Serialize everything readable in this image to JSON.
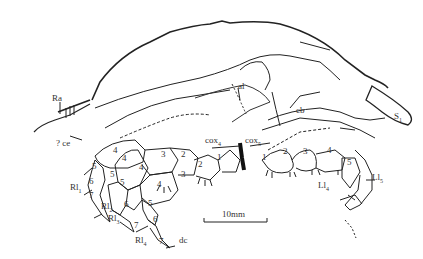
{
  "figure": {
    "type": "line drawing of fossil arthropod (lateral view)",
    "scale_bar": {
      "label": "10mm"
    },
    "labels": {
      "Ra": "Ra",
      "ce": "? ce",
      "al": "al",
      "cb": "cb",
      "S1": "S",
      "S1_sub": "1",
      "cox4": "cox",
      "cox4_sub": "4",
      "cox5": "cox",
      "cox5_sub": "5",
      "Rl1": "Rl",
      "Rl1_sub": "1",
      "Rl2": "Rl",
      "Rl2_sub": "2",
      "Rl3": "Rl",
      "Rl3_sub": "3",
      "Rl4": "Rl",
      "Rl4_sub": "4",
      "Ll4": "Ll",
      "Ll4_sub": "4",
      "Ll5": "Ll",
      "Ll5_sub": "5",
      "dc": "dc"
    },
    "segment_numbers": {
      "rl1": [
        "4",
        "5",
        "6",
        "7"
      ],
      "rl2": [
        "4",
        "5",
        "6",
        "7"
      ],
      "rl3": [
        "3",
        "4",
        "5",
        "6",
        "7"
      ],
      "rl4": [
        "2",
        "3",
        "4",
        "5",
        "6",
        "7"
      ],
      "rl5": [
        "1",
        "2"
      ],
      "left": [
        "1",
        "2",
        "3",
        "4",
        "5"
      ]
    }
  }
}
